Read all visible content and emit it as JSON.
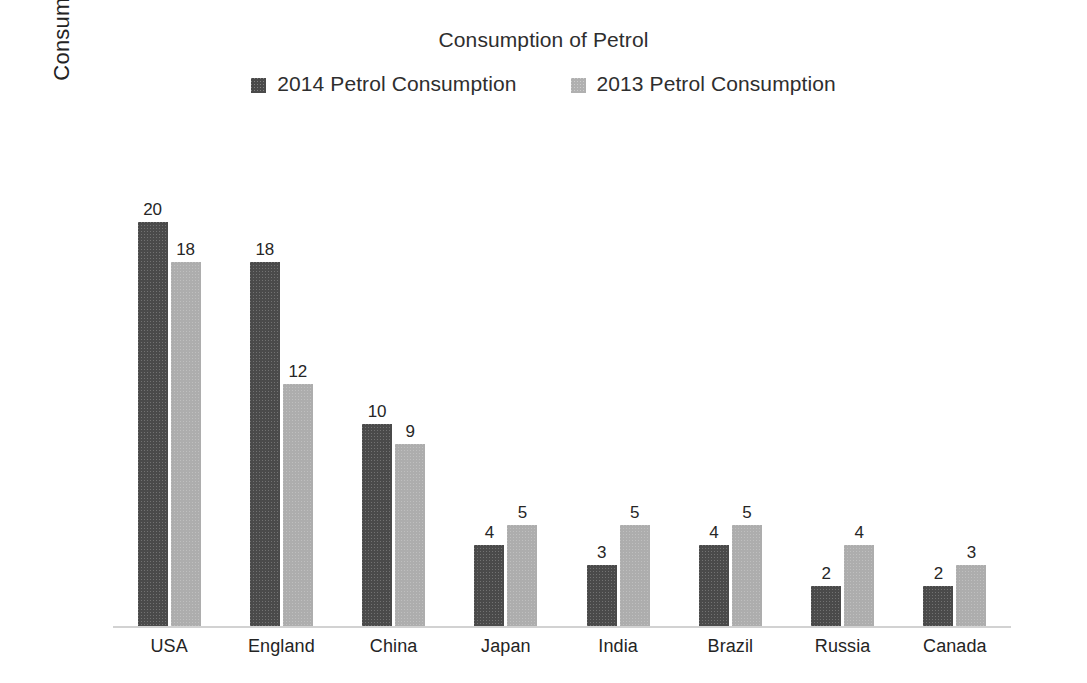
{
  "chart_data": {
    "type": "bar",
    "title": "Consumption of Petrol",
    "xlabel": "",
    "ylabel": "Consumption (millions) per day",
    "categories": [
      "USA",
      "England",
      "China",
      "Japan",
      "India",
      "Brazil",
      "Russia",
      "Canada"
    ],
    "series": [
      {
        "name": "2014 Petrol Consumption",
        "color": "#4a4a4a",
        "values": [
          20,
          18,
          10,
          4,
          3,
          4,
          2,
          2
        ]
      },
      {
        "name": "2013 Petrol Consumption",
        "color": "#adadad",
        "values": [
          18,
          12,
          9,
          5,
          5,
          5,
          4,
          3
        ]
      }
    ],
    "ylim": [
      0,
      20
    ],
    "grid": false,
    "legend_position": "top",
    "data_labels": true,
    "axis_line_color": "#d2d2d2",
    "background_color": "#ffffff",
    "text_color": "#2b2b2b"
  },
  "legend": {
    "items": [
      {
        "label": "2014 Petrol Consumption",
        "swatch": "legend-swatch-2014"
      },
      {
        "label": "2013 Petrol Consumption",
        "swatch": "legend-swatch-2013"
      }
    ]
  }
}
